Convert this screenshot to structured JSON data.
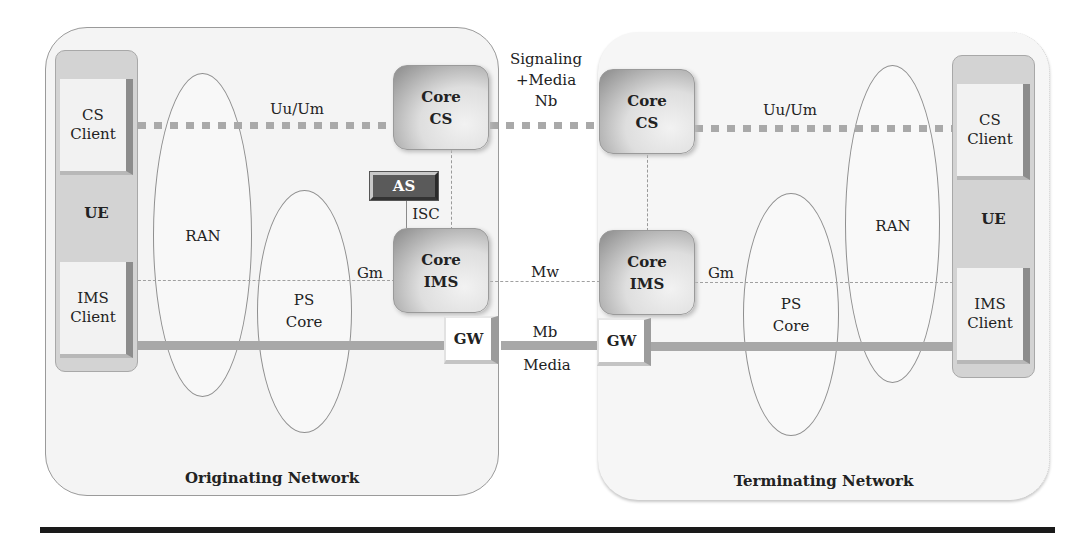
{
  "networks": {
    "originating": {
      "label": "Originating Network"
    },
    "terminating": {
      "label": "Terminating Network"
    }
  },
  "ue": {
    "left": {
      "cs_client": [
        "CS",
        "Client"
      ],
      "label": "UE",
      "ims_client": [
        "IMS",
        "Client"
      ]
    },
    "right": {
      "cs_client": [
        "CS",
        "Client"
      ],
      "label": "UE",
      "ims_client": [
        "IMS",
        "Client"
      ]
    }
  },
  "access": {
    "left": {
      "ran": "RAN",
      "ps_core": [
        "PS",
        "Core"
      ]
    },
    "right": {
      "ran": "RAN",
      "ps_core": [
        "PS",
        "Core"
      ]
    }
  },
  "nodes": {
    "core_cs_left": [
      "Core",
      "CS"
    ],
    "core_cs_right": [
      "Core",
      "CS"
    ],
    "core_ims_left": [
      "Core",
      "IMS"
    ],
    "core_ims_right": [
      "Core",
      "IMS"
    ],
    "as": "AS",
    "gw_left": "GW",
    "gw_right": "GW"
  },
  "interfaces": {
    "uu_um_left": "Uu/Um",
    "uu_um_right": "Uu/Um",
    "nb": [
      "Signaling",
      "+Media",
      "Nb"
    ],
    "isc": "ISC",
    "gm_left": "Gm",
    "gm_right": "Gm",
    "mw": "Mw",
    "mb": "Mb",
    "media": "Media"
  },
  "colors": {
    "cs_link": "#a9a9a9",
    "media_link": "#a8a8a8",
    "signaling_link": "#a0a0a0",
    "as_fill": "#5a5a5a",
    "rule": "#1a1a1a"
  }
}
